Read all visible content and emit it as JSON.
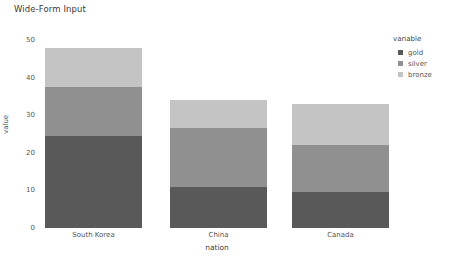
{
  "chart_data": {
    "type": "bar",
    "subtype": "stacked",
    "title": "Wide-Form Input",
    "xlabel": "nation",
    "ylabel": "value",
    "categories": [
      "South Korea",
      "China",
      "Canada"
    ],
    "series": [
      {
        "name": "gold",
        "color": "#595959",
        "values": [
          24.5,
          11.0,
          9.5
        ]
      },
      {
        "name": "silver",
        "color": "#909090",
        "values": [
          13.0,
          15.5,
          12.5
        ]
      },
      {
        "name": "bronze",
        "color": "#c4c4c4",
        "values": [
          10.5,
          7.5,
          11.0
        ]
      }
    ],
    "totals": [
      48.0,
      34.0,
      33.0
    ],
    "ylim": [
      0,
      50
    ],
    "yticks": [
      0,
      10,
      20,
      30,
      40,
      50
    ],
    "ytick_labels": [
      "0",
      "10",
      "20",
      "30",
      "40",
      "50"
    ],
    "grid": false,
    "legend": {
      "title": "variable",
      "position": "right",
      "entries": [
        "gold",
        "silver",
        "bronze"
      ]
    }
  },
  "colors": {
    "background": "#ffffff",
    "title_text": "#3a3a3a",
    "axis_text": "#555555"
  }
}
